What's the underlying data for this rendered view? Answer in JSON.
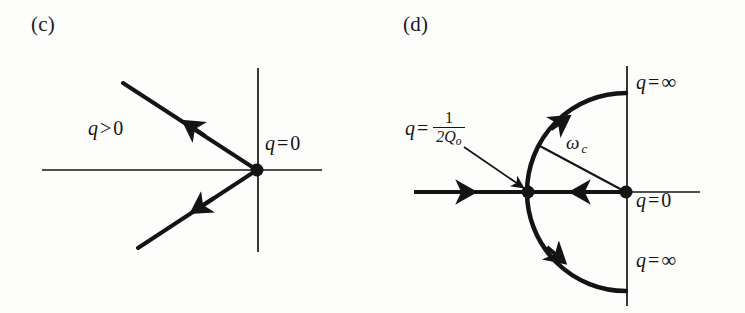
{
  "figure": {
    "type": "root-locus-diagram-pair",
    "background_color": "#fdfdfc",
    "ink_color": "#141414",
    "width": 745,
    "height": 313
  },
  "panels": [
    {
      "id": "c",
      "label": "(c)",
      "description": "Two straight locus branches leaving the origin into the left half-plane",
      "axes": {
        "horizontal": {
          "x1": 42,
          "y1": 170,
          "x2": 322,
          "y2": 170,
          "stroke_width": 1.7
        },
        "vertical": {
          "x1": 258,
          "y1": 68,
          "x2": 258,
          "y2": 252,
          "stroke_width": 1.7
        }
      },
      "origin": {
        "x": 257,
        "y": 170,
        "dot_radius": 6.5
      },
      "branches": [
        {
          "name": "upper-branch",
          "from": {
            "x": 257,
            "y": 170
          },
          "to": {
            "x": 123,
            "y": 83
          },
          "stroke_width": 4,
          "arrow": {
            "x": 193,
            "y": 127,
            "direction": "up-left"
          }
        },
        {
          "name": "lower-branch",
          "from": {
            "x": 257,
            "y": 170
          },
          "to": {
            "x": 138,
            "y": 248
          },
          "stroke_width": 4,
          "arrow": {
            "x": 201,
            "y": 207,
            "direction": "down-left"
          }
        }
      ],
      "labels": [
        {
          "name": "q-greater-than-zero",
          "text": "q > 0",
          "var": "q",
          "op": ">",
          "value": "0",
          "x": 88,
          "y": 118
        },
        {
          "name": "q-equals-zero",
          "text": "q = 0",
          "var": "q",
          "op": "=",
          "value": "0",
          "x": 265,
          "y": 133
        }
      ]
    },
    {
      "id": "d",
      "label": "(d)",
      "description": "Circular locus of radius omega-c breaking away at q = 1/(2Qo) and terminating on the imaginary axis at q = infinity",
      "axes": {
        "horizontal": {
          "x1": 414,
          "y1": 192,
          "x2": 700,
          "y2": 192,
          "stroke_width": 1.7
        },
        "vertical": {
          "x1": 627,
          "y1": 66,
          "x2": 627,
          "y2": 306,
          "stroke_width": 1.7
        }
      },
      "origin": {
        "x": 626,
        "y": 192,
        "dot_radius": 6.5
      },
      "breakaway_point": {
        "x": 528,
        "y": 192,
        "dot_radius": 6.5
      },
      "arc": {
        "name": "omega-c-circle",
        "center": {
          "x": 626,
          "y": 192
        },
        "radius": 99,
        "start_angle_deg": 62,
        "end_angle_deg": -62,
        "stroke_width": 4.5,
        "arrows": [
          {
            "name": "upper-arc-arrow",
            "angle_deg": 128,
            "direction": "counter-clockwise"
          },
          {
            "name": "lower-arc-arrow",
            "angle_deg": -142,
            "direction": "clockwise"
          }
        ]
      },
      "real_axis_segments": [
        {
          "name": "left-real-branch",
          "from": {
            "x": 414,
            "y": 192
          },
          "to": {
            "x": 528,
            "y": 192
          },
          "stroke_width": 4,
          "arrow": {
            "x": 470,
            "y": 192,
            "direction": "right"
          }
        },
        {
          "name": "right-real-branch",
          "from": {
            "x": 626,
            "y": 192
          },
          "to": {
            "x": 528,
            "y": 192
          },
          "stroke_width": 4,
          "arrow": {
            "x": 578,
            "y": 192,
            "direction": "left"
          }
        }
      ],
      "radius_line": {
        "name": "omega-c-radius",
        "from": {
          "x": 626,
          "y": 192
        },
        "to": {
          "x": 538,
          "y": 145
        },
        "stroke_width": 2
      },
      "pointer": {
        "name": "breakaway-pointer-arrow",
        "from": {
          "x": 464,
          "y": 147
        },
        "to": {
          "x": 521,
          "y": 186
        },
        "stroke_width": 1.8
      },
      "labels": [
        {
          "name": "q-equals-one-over-two-Qo",
          "text": "q = 1/2Qo",
          "var": "q",
          "op": "=",
          "numerator": "1",
          "denominator": "2Q",
          "denominator_subscript": "o",
          "x": 405,
          "y": 118
        },
        {
          "name": "omega-c",
          "text": "ωc",
          "symbol": "ω",
          "subscript": "c",
          "x": 566,
          "y": 138
        },
        {
          "name": "q-equals-infinity-upper",
          "text": "q = ∞",
          "var": "q",
          "op": "=",
          "value": "∞",
          "x": 636,
          "y": 78
        },
        {
          "name": "q-equals-zero",
          "text": "q = 0",
          "var": "q",
          "op": "=",
          "value": "0",
          "x": 636,
          "y": 193
        },
        {
          "name": "q-equals-infinity-lower",
          "text": "q = ∞",
          "var": "q",
          "op": "=",
          "value": "∞",
          "x": 636,
          "y": 254
        }
      ]
    }
  ]
}
